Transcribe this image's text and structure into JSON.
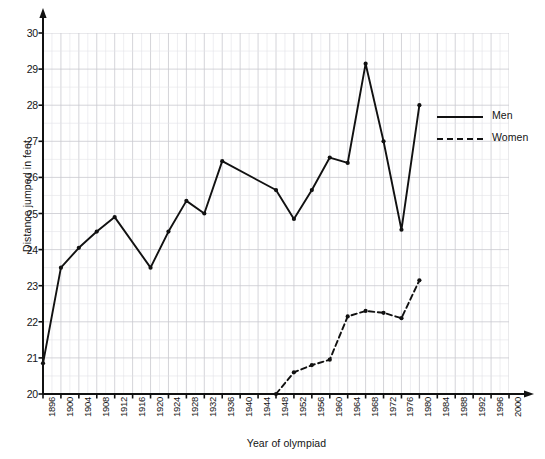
{
  "chart_data": {
    "type": "line",
    "title": "",
    "xlabel": "Year of olympiad",
    "ylabel": "Distance jumped in feet",
    "xlim": [
      1896,
      2000
    ],
    "ylim": [
      20,
      30
    ],
    "x_tick_step": 4,
    "y_tick_step": 1,
    "grid": "major and minor gridlines, light gray",
    "legend_position": "upper right inside plot",
    "x_ticks": [
      "1896",
      "1900",
      "1904",
      "1908",
      "1912",
      "1916",
      "1920",
      "1924",
      "1928",
      "1932",
      "1936",
      "1940",
      "1944",
      "1948",
      "1952",
      "1956",
      "1960",
      "1964",
      "1968",
      "1972",
      "1976",
      "1980",
      "1984",
      "1988",
      "1992",
      "1996",
      "2000"
    ],
    "y_ticks": [
      "20",
      "21",
      "22",
      "23",
      "24",
      "25",
      "26",
      "27",
      "28",
      "29",
      "30"
    ],
    "series": [
      {
        "name": "Men",
        "style": "solid",
        "marker": "dot",
        "points": [
          {
            "x": 1896,
            "y": 20.85
          },
          {
            "x": 1900,
            "y": 23.5
          },
          {
            "x": 1904,
            "y": 24.05
          },
          {
            "x": 1908,
            "y": 24.5
          },
          {
            "x": 1912,
            "y": 24.9
          },
          {
            "x": 1920,
            "y": 23.5
          },
          {
            "x": 1924,
            "y": 24.5
          },
          {
            "x": 1928,
            "y": 25.35
          },
          {
            "x": 1932,
            "y": 25.0
          },
          {
            "x": 1936,
            "y": 26.45
          },
          {
            "x": 1948,
            "y": 25.65
          },
          {
            "x": 1952,
            "y": 24.85
          },
          {
            "x": 1956,
            "y": 25.65
          },
          {
            "x": 1960,
            "y": 26.55
          },
          {
            "x": 1964,
            "y": 26.4
          },
          {
            "x": 1968,
            "y": 29.15
          },
          {
            "x": 1972,
            "y": 27.0
          },
          {
            "x": 1976,
            "y": 24.55
          },
          {
            "x": 1980,
            "y": 28.0
          }
        ]
      },
      {
        "name": "Women",
        "style": "dashed",
        "marker": "dot",
        "points": [
          {
            "x": 1948,
            "y": 20.0
          },
          {
            "x": 1952,
            "y": 20.6
          },
          {
            "x": 1956,
            "y": 20.8
          },
          {
            "x": 1960,
            "y": 20.95
          },
          {
            "x": 1964,
            "y": 22.15
          },
          {
            "x": 1968,
            "y": 22.3
          },
          {
            "x": 1972,
            "y": 22.25
          },
          {
            "x": 1976,
            "y": 22.1
          },
          {
            "x": 1980,
            "y": 23.15
          }
        ]
      }
    ]
  },
  "legend": {
    "men_label": "Men",
    "women_label": "Women"
  },
  "axis_titles": {
    "x": "Year of olympiad",
    "y": "Distance jumped in feet"
  },
  "colors": {
    "line": "#111111",
    "grid_major": "#c9c9cf",
    "grid_minor": "#e3e3e8",
    "axis": "#111111",
    "background": "#ffffff"
  }
}
